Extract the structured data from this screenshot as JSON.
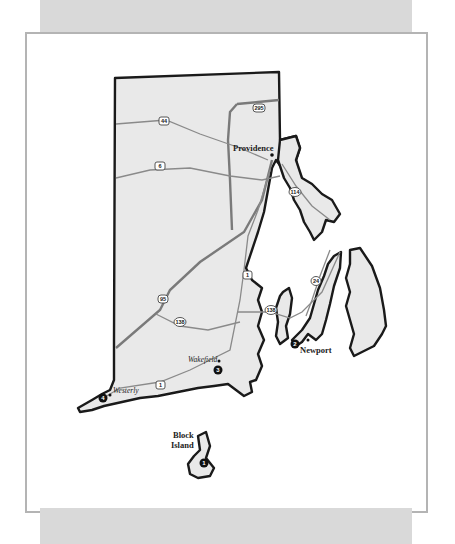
{
  "map": {
    "title": "Rhode Island",
    "cities": [
      {
        "name": "Providence",
        "style": "bold"
      },
      {
        "name": "Newport",
        "style": "bold"
      },
      {
        "name": "Wakefield",
        "style": "italic"
      },
      {
        "name": "Westerly",
        "style": "italic"
      },
      {
        "name": "Block\nIsland",
        "line1": "Block",
        "line2": "Island",
        "style": "bold"
      }
    ],
    "routes": [
      {
        "id": "295",
        "type": "interstate"
      },
      {
        "id": "44",
        "type": "us"
      },
      {
        "id": "6",
        "type": "us"
      },
      {
        "id": "95",
        "type": "interstate"
      },
      {
        "id": "1",
        "type": "us"
      },
      {
        "id": "114",
        "type": "state"
      },
      {
        "id": "24",
        "type": "state"
      },
      {
        "id": "138",
        "type": "state"
      },
      {
        "id": "138",
        "type": "state"
      }
    ],
    "markers": [
      {
        "number": "1",
        "location": "Block Island"
      },
      {
        "number": "2",
        "location": "Newport"
      },
      {
        "number": "3",
        "location": "Wakefield"
      },
      {
        "number": "4",
        "location": "Westerly"
      }
    ],
    "colors": {
      "land": "#e9e9e9",
      "outline": "#1a1a1a",
      "road": "#8a8a8a",
      "band": "#d9d9d9",
      "frame_border": "#b4b4b4"
    }
  }
}
